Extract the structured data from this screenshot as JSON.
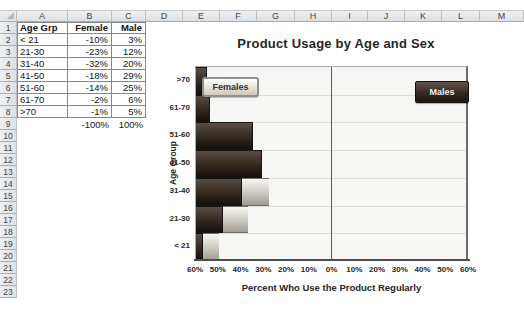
{
  "sheet": {
    "columns": [
      "A",
      "B",
      "C",
      "D",
      "E",
      "F",
      "G",
      "H",
      "I",
      "J",
      "K",
      "L",
      "M"
    ],
    "row_count": 23,
    "table": {
      "headers": [
        "Age Grp",
        "Female",
        "Male"
      ],
      "rows": [
        [
          "< 21",
          "-10%",
          "3%"
        ],
        [
          "21-30",
          "-23%",
          "12%"
        ],
        [
          "31-40",
          "-32%",
          "20%"
        ],
        [
          "41-50",
          "-18%",
          "29%"
        ],
        [
          "51-60",
          "-14%",
          "25%"
        ],
        [
          "61-70",
          "-2%",
          "6%"
        ],
        [
          ">70",
          "-1%",
          "5%"
        ]
      ],
      "totals_row": [
        "",
        "-100%",
        "100%"
      ]
    }
  },
  "chart_data": {
    "type": "bar",
    "orientation": "horizontal-pyramid",
    "title": "Product Usage by Age and Sex",
    "xlabel": "Percent Who Use the Product Regularly",
    "ylabel": "Age Group",
    "categories_top_to_bottom": [
      ">70",
      "61-70",
      "51-60",
      "41-50",
      "31-40",
      "21-30",
      "< 21"
    ],
    "series": [
      {
        "name": "Females",
        "values": [
          1,
          2,
          14,
          18,
          32,
          23,
          10
        ]
      },
      {
        "name": "Males",
        "values": [
          5,
          6,
          25,
          29,
          20,
          12,
          3
        ]
      }
    ],
    "x_tick_labels": [
      "60%",
      "50%",
      "40%",
      "30%",
      "20%",
      "10%",
      "0%",
      "10%",
      "20%",
      "30%",
      "40%",
      "50%",
      "60%"
    ],
    "xlim": [
      -60,
      60
    ],
    "grid": "horizontal-band-lines",
    "legend_position": "inside-plot-floating-labels",
    "colors": {
      "female_gradient_top": "#f8f7f4",
      "female_gradient_bottom": "#a09c92",
      "female_border": "#6e6e6e",
      "male_gradient_top": "#5a4e47",
      "male_gradient_bottom": "#16100e",
      "male_border": "#141414",
      "plot_fill": "#f6f6f4",
      "gridline": "#dedcd8"
    }
  }
}
